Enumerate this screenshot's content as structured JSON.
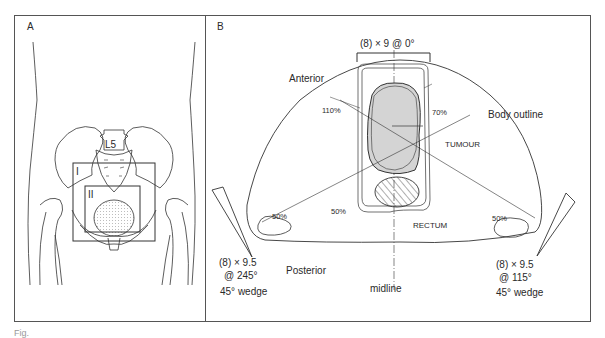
{
  "figure": {
    "caption_fragment": "Fig.",
    "panel_a": {
      "label": "A",
      "vertebra_label": "L5",
      "field_labels": [
        "I",
        "II"
      ]
    },
    "panel_b": {
      "label": "B",
      "orientation": {
        "anterior": "Anterior",
        "posterior": "Posterior",
        "midline": "midline"
      },
      "structures": {
        "body_outline": "Body outline",
        "tumour": "TUMOUR",
        "rectum": "RECTUM"
      },
      "isodoses": {
        "high": "110%",
        "mid": "70%",
        "low_center": "50%",
        "low_left": "50%",
        "low_right": "50%"
      },
      "beams": [
        {
          "name": "anterior",
          "line1": "(8) × 9 @ 0°",
          "line2": "",
          "line3": ""
        },
        {
          "name": "left-posterior-oblique",
          "line1": "(8) × 9.5",
          "line2": "@ 245°",
          "line3": "45° wedge"
        },
        {
          "name": "right-posterior-oblique",
          "line1": "(8) × 9.5",
          "line2": "@ 115°",
          "line3": "45° wedge"
        }
      ]
    },
    "colors": {
      "line": "#2a2a2a",
      "tumour_fill": "#d4d4d4",
      "frame": "#555555"
    }
  }
}
